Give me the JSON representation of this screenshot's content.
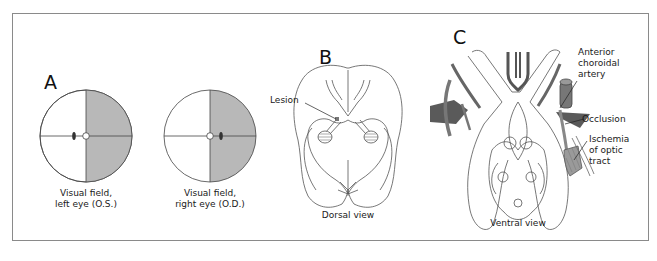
{
  "figure": {
    "panels": [
      {
        "id": "A",
        "letter": "A",
        "fields": [
          {
            "caption_line1": "Visual field,",
            "caption_line2": "left eye (O.S.)",
            "shaded_half": "right"
          },
          {
            "caption_line1": "Visual field,",
            "caption_line2": "right eye (O.D.)",
            "shaded_half": "right"
          }
        ]
      },
      {
        "id": "B",
        "letter": "B",
        "labels": {
          "lesion": "Lesion"
        },
        "caption": "Dorsal view"
      },
      {
        "id": "C",
        "letter": "C",
        "labels": {
          "artery_line1": "Anterior",
          "artery_line2": "choroidal",
          "artery_line3": "artery",
          "occlusion": "Occlusion",
          "ischemia_line1": "Ischemia",
          "ischemia_line2": "of optic",
          "ischemia_line3": "tract"
        },
        "caption": "Ventral view"
      }
    ],
    "colors": {
      "shade": "#b8b8b8",
      "dark_vessel": "#5a5a5a",
      "line": "#444444",
      "frame": "#8a8a8a"
    }
  }
}
